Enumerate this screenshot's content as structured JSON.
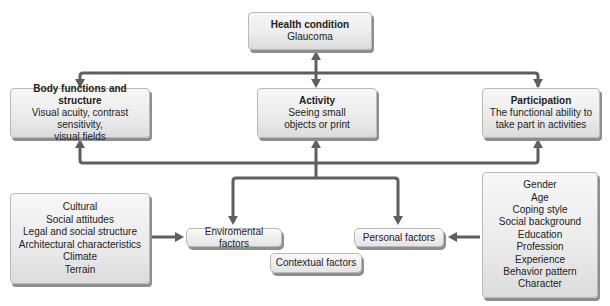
{
  "health_condition": {
    "title": "Health condition",
    "detail": "Glaucoma"
  },
  "body_functions": {
    "title": "Body functions and structure",
    "lines": [
      "Visual acuity, contrast sensitivity,",
      "visual fields"
    ]
  },
  "activity": {
    "title": "Activity",
    "lines": [
      "Seeing small",
      "objects or print"
    ]
  },
  "participation": {
    "title": "Participation",
    "lines": [
      "The functional ability to",
      "take part in activities"
    ]
  },
  "environmental_list": {
    "lines": [
      "Cultural",
      "Social attitudes",
      "Legal and social structure",
      "Architectural characteristics",
      "Climate",
      "Terrain"
    ]
  },
  "environmental_factors": {
    "label": "Enviromental factors"
  },
  "personal_factors": {
    "label": "Personal factors"
  },
  "contextual_factors": {
    "label": "Contextual factors"
  },
  "personal_list": {
    "lines": [
      "Gender",
      "Age",
      "Coping style",
      "Social background",
      "Education",
      "Profession",
      "Experience",
      "Behavior pattern",
      "Character"
    ]
  },
  "colors": {
    "arrow": "#5f5f5f",
    "box_border": "#b9b9b9",
    "box_shadow": "#8e8e8e"
  }
}
